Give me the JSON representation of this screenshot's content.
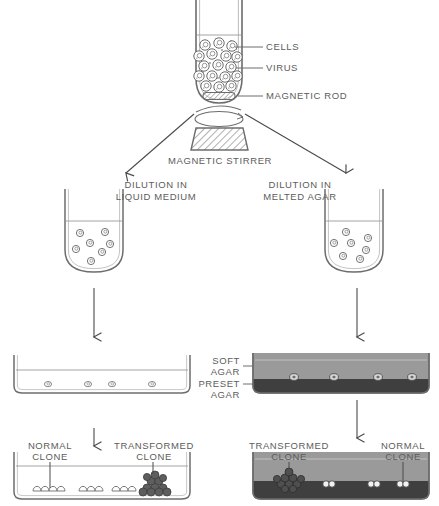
{
  "figure": {
    "background_color": "#ffffff",
    "ink_color": "#5c5c5c",
    "soft_agar_color": "#9a9a9a",
    "preset_agar_color": "#4a4a4a",
    "clone_dark_color": "#545454"
  },
  "labels": {
    "cells": "CELLS",
    "virus": "VIRUS",
    "magnetic_rod": "MAGNETIC ROD",
    "magnetic_stirrer": "MAGNETIC STIRRER",
    "dilution_liquid_line1": "DILUTION IN",
    "dilution_liquid_line2": "LIQUID MEDIUM",
    "dilution_agar_line1": "DILUTION IN",
    "dilution_agar_line2": "MELTED AGAR",
    "soft_agar_line1": "SOFT",
    "soft_agar_line2": "AGAR",
    "preset_agar_line1": "PRESET",
    "preset_agar_line2": "AGAR",
    "normal_clone_left_line1": "NORMAL",
    "normal_clone_left_line2": "CLONE",
    "transformed_clone_left_line1": "TRANSFORMED",
    "transformed_clone_left_line2": "CLONE",
    "transformed_clone_right_line1": "TRANSFORMED",
    "transformed_clone_right_line2": "CLONE",
    "normal_clone_right_line1": "NORMAL",
    "normal_clone_right_line2": "CLONE"
  },
  "stages": {
    "top_tube": {
      "cells_count": 17,
      "virus_dots": true,
      "has_magnetic_rod": true
    },
    "left_tube": {
      "cells_count": 7,
      "medium": "liquid"
    },
    "right_tube": {
      "cells_count": 7,
      "medium": "melted agar"
    },
    "left_dish_upper": {
      "cells_count": 4,
      "filled": false
    },
    "right_dish_upper": {
      "cells_count": 4,
      "layers": [
        "soft agar",
        "preset agar"
      ]
    },
    "left_dish_lower": {
      "normal_clones": 3,
      "transformed_clones": 1
    },
    "right_dish_lower": {
      "normal_clones": 3,
      "transformed_clones": 1
    }
  }
}
